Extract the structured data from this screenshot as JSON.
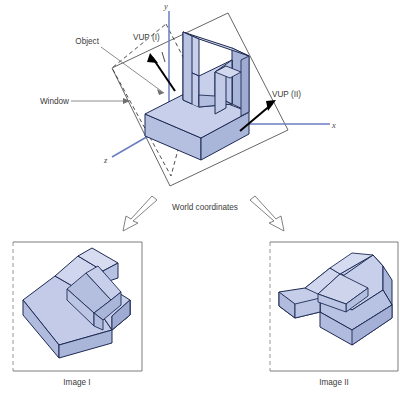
{
  "figure": {
    "title_absent": true,
    "labels": {
      "vup1": "VUP (I)",
      "vup2": "VUP (II)",
      "object": "Object",
      "window": "Window",
      "world_coordinates": "World coordinates",
      "image1_caption": "Image I",
      "image2_caption": "Image II"
    },
    "axes": {
      "x": "x",
      "y": "y",
      "z": "z"
    },
    "colors": {
      "solid_fill": "#c3cbe8",
      "solid_edge": "#1d2a52",
      "axis_blue": "#6a7ec0",
      "leader_gray": "#6e6e6e",
      "plane_outline": "#555555",
      "arrow_black": "#000000",
      "text": "#3b3b3b",
      "background": "#ffffff"
    }
  }
}
